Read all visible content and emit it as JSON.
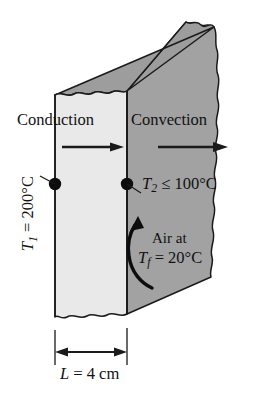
{
  "figure": {
    "background_color": "#ffffff",
    "line_color": "#1a1a1a"
  },
  "wall": {
    "front_face_color": "#e9e9e9",
    "side_face_color": "#a2a2a2",
    "top_face_color": "#9d9d9d",
    "front_left_x": 55,
    "front_right_x": 127,
    "description": "Plane wall slab shown in 3D with torn top and bottom edges"
  },
  "labels": {
    "conduction": "Conduction",
    "convection": "Convection",
    "t1_symbol": "T",
    "t1_subscript": "1",
    "t1_value": " = 200°C",
    "t2_symbol": "T",
    "t2_subscript": "2",
    "t2_value": " ≤ 100°C",
    "air_at": "Air at",
    "tf_symbol": "T",
    "tf_subscript": "f",
    "tf_value": " = 20°C",
    "length_symbol": "L",
    "length_value": " = 4 cm"
  },
  "arrows": {
    "conduction_arrow": "straight-right-arrow",
    "convection_arrow": "straight-right-arrow",
    "air_arrow": "curved-up-arrow",
    "dimension_arrow": "double-headed-horizontal-arrow"
  },
  "nodes": {
    "t1_node": "surface-point-left",
    "t2_node": "surface-point-right"
  },
  "dimension": {
    "label": "L = 4 cm",
    "value": 4,
    "unit": "cm",
    "extension_left_x": 55,
    "extension_right_x": 127,
    "line_y": 352
  }
}
